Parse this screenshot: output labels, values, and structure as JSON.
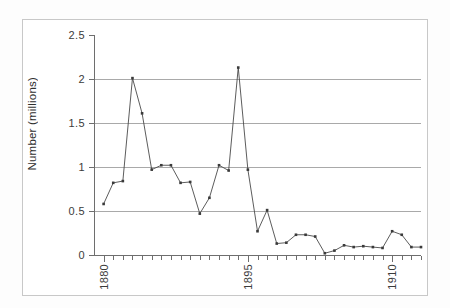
{
  "chart_data": {
    "type": "line",
    "title": "",
    "subtitle": "",
    "xlabel": "",
    "ylabel": "Number (millions)",
    "xlim": [
      1879,
      1913
    ],
    "ylim": [
      0,
      2.5
    ],
    "grid": true,
    "legend": null,
    "y_ticks": [
      0,
      0.5,
      1,
      1.5,
      2,
      2.5
    ],
    "y_tick_labels": [
      "0",
      "0.5",
      "1",
      "1.5",
      "2",
      "2.5"
    ],
    "x_tick_labels": [
      "1880",
      "1895",
      "1910"
    ],
    "x_labeled_years": [
      1880,
      1895,
      1910
    ],
    "x_minor_tick_years": [
      1880,
      1881,
      1882,
      1883,
      1884,
      1885,
      1886,
      1887,
      1888,
      1889,
      1890,
      1891,
      1892,
      1893,
      1894,
      1895,
      1896,
      1897,
      1898,
      1899,
      1900,
      1901,
      1902,
      1903,
      1904,
      1905,
      1906,
      1907,
      1908,
      1909,
      1910,
      1911,
      1912,
      1913
    ],
    "marker": "square",
    "marker_size": 2,
    "line_color": "#4a4a4a",
    "grid_color": "#a9a9a9",
    "axis_color": "#6e6e6e",
    "series": [
      {
        "name": "Number (millions)",
        "x": [
          1880,
          1881,
          1882,
          1883,
          1884,
          1885,
          1886,
          1887,
          1888,
          1889,
          1890,
          1891,
          1892,
          1893,
          1894,
          1895,
          1896,
          1897,
          1898,
          1899,
          1900,
          1901,
          1902,
          1903,
          1904,
          1905,
          1906,
          1907,
          1908,
          1909,
          1910,
          1911,
          1912,
          1913
        ],
        "values": [
          0.58,
          0.82,
          0.84,
          2.01,
          1.61,
          0.97,
          1.02,
          1.02,
          0.82,
          0.83,
          0.47,
          0.65,
          1.02,
          0.96,
          2.13,
          0.97,
          0.27,
          0.51,
          0.13,
          0.14,
          0.23,
          0.23,
          0.21,
          0.02,
          0.05,
          0.11,
          0.09,
          0.1,
          0.09,
          0.08,
          0.27,
          0.23,
          0.09,
          0.09
        ]
      }
    ]
  },
  "axis": {
    "y_title": "Number (millions)"
  }
}
